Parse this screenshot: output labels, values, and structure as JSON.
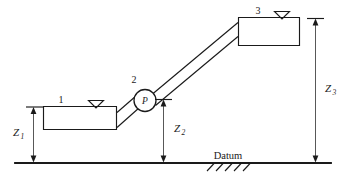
{
  "figure": {
    "type": "engineering-schematic",
    "background_color": "#ffffff",
    "line_color": "#1a1a1a"
  },
  "nodes": {
    "reservoir_1": {
      "label": "1",
      "description": "lower open reservoir (suction side)",
      "water_surface_marker": "water-level-triangle"
    },
    "pump": {
      "label": "2",
      "symbol_letter": "P",
      "description": "pump located on the inclined pipeline"
    },
    "reservoir_3": {
      "label": "3",
      "description": "upper open reservoir (discharge side)",
      "water_surface_marker": "water-level-triangle"
    }
  },
  "dimensions": [
    {
      "id": "z1",
      "base": "Z",
      "subscript": "1",
      "description": "elevation of reservoir 1 free surface above datum"
    },
    {
      "id": "z2",
      "base": "Z",
      "subscript": "2",
      "description": "elevation of pump centerline above datum"
    },
    {
      "id": "z3",
      "base": "Z",
      "subscript": "3",
      "description": "elevation of reservoir 3 free surface above datum"
    }
  ],
  "datum": {
    "label": "Datum",
    "style": "hatched ground line"
  }
}
